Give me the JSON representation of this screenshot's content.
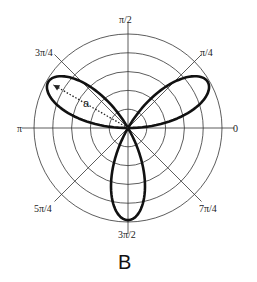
{
  "chart_data": {
    "type": "line",
    "subtype": "polar",
    "title": "",
    "panel_label": "B",
    "equation_hint": "three-petal rose",
    "center": [
      128,
      128
    ],
    "radial_grid": {
      "circles": 5,
      "ticks_fraction": [
        0.2,
        0.4,
        0.6,
        0.8,
        1.0
      ]
    },
    "angular_ticks": [
      {
        "angle_deg": 0,
        "label": "0"
      },
      {
        "angle_deg": 45,
        "label": "π/4"
      },
      {
        "angle_deg": 90,
        "label": "π/2"
      },
      {
        "angle_deg": 135,
        "label": "3π/4"
      },
      {
        "angle_deg": 180,
        "label": "π"
      },
      {
        "angle_deg": 225,
        "label": "5π/4"
      },
      {
        "angle_deg": 270,
        "label": "3π/2"
      },
      {
        "angle_deg": 315,
        "label": "7π/4"
      }
    ],
    "series": [
      {
        "name": "rose",
        "petals": 3,
        "petal_angles_deg": [
          30,
          150,
          270
        ],
        "amplitude_fraction": 0.98
      }
    ],
    "annotations": [
      {
        "type": "dotted-arrow",
        "label": "a",
        "from_angle_deg": 150,
        "note": "from origin to tip of upper-left petal"
      }
    ],
    "grid": true,
    "legend": null
  },
  "labels": {
    "t0": "0",
    "t45": "π/4",
    "t90": "π/2",
    "t135": "3π/4",
    "t180": "π",
    "t225": "5π/4",
    "t270": "3π/2",
    "t315": "7π/4",
    "annot_a": "a",
    "panel": "B"
  }
}
